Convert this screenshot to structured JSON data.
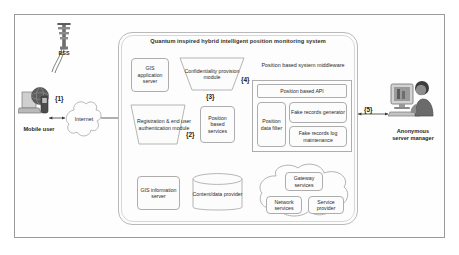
{
  "diagram": {
    "title": "Quantum inspired hybrid intelligent position monitoring system",
    "left": {
      "bss_label": "BSS",
      "mobile_user_label": "Mobile user",
      "internet_label": "Internet"
    },
    "right": {
      "server_manager_label": "Anonymous\nserver manager",
      "server_manager_line1": "Anonymous",
      "server_manager_line2": "server manager"
    },
    "nodes": {
      "gis_application_server": "GIS application server",
      "confidentiality_provision_module": "Confidentiality provision module",
      "registration_module": "Registration & end user authentication module",
      "position_based_services": "Position based services",
      "middleware_label": "Position based system middleware",
      "position_based_api": "Position based API",
      "position_data_filter": "Position data filter",
      "fake_records_generator": "Fake records generator",
      "fake_records_log": "Fake records log maintenance",
      "gis_information_server": "GIS information server",
      "content_data_provider": "Content/data provider",
      "gateway_services": "Gateway services",
      "network_services": "Network services",
      "service_provider": "Service provider"
    },
    "steps": {
      "s1": "{1}",
      "s2": "{2}",
      "s3": "{3}",
      "s4": "{4}",
      "s5": "{5}"
    },
    "colors": {
      "frame_border": "#9a9a9a",
      "node_border": "#adadad",
      "background": "#ffffff",
      "text": "#2b2b2b"
    }
  }
}
